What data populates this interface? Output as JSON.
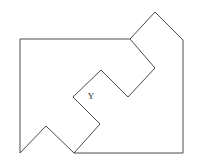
{
  "figure": {
    "canvas": {
      "width": 198,
      "height": 164,
      "background": "#ffffff"
    },
    "stroke_color": "#4a4a4a",
    "stroke_width": 1,
    "fill_color": "#ffffff",
    "shape": {
      "type": "polygon",
      "closed": true,
      "vertex_count": 13,
      "points": [
        [
          20,
          39
        ],
        [
          130,
          39
        ],
        [
          155,
          12
        ],
        [
          183,
          40
        ],
        [
          183,
          153
        ],
        [
          74,
          153
        ],
        [
          100,
          124
        ],
        [
          73,
          97
        ],
        [
          101,
          70
        ],
        [
          128,
          97
        ],
        [
          155,
          68
        ],
        [
          130,
          39
        ],
        [
          20,
          39
        ]
      ],
      "points_svg": "20,39 130,39 155,12 183,40 183,153 74,153 100,124 73,97 101,70 128,97 155,68 130,39",
      "outer_boundary": "20,39 130,39 155,12 183,40 183,153 74,153 46,126 20,153 20,39",
      "outer_points": [
        [
          20,
          39
        ],
        [
          130,
          39
        ],
        [
          155,
          12
        ],
        [
          183,
          40
        ],
        [
          183,
          153
        ],
        [
          74,
          153
        ],
        [
          46,
          126
        ],
        [
          20,
          153
        ]
      ],
      "notch_points": [
        [
          130,
          39
        ],
        [
          155,
          68
        ],
        [
          128,
          97
        ],
        [
          101,
          70
        ],
        [
          73,
          97
        ],
        [
          100,
          124
        ],
        [
          74,
          153
        ]
      ]
    },
    "labels": [
      {
        "text": "Y",
        "x": 95,
        "y": 99,
        "font_size": 9,
        "color": "#2b2b2b"
      }
    ]
  }
}
